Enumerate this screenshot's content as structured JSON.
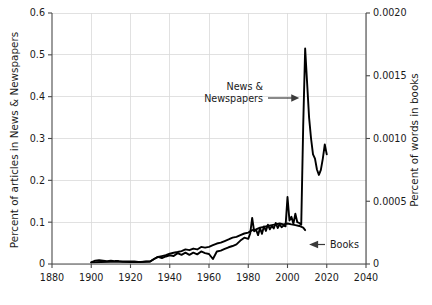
{
  "chart_data": {
    "type": "line",
    "title": "",
    "xlabel": "",
    "ylabel": "Percent of articles in News & Newspapers",
    "y2label": "Percent of words in books",
    "xlim": [
      1880,
      2040
    ],
    "ylim": [
      0,
      0.6
    ],
    "y2lim": [
      0,
      0.002
    ],
    "grid": true,
    "legend": "none (inline annotations)",
    "x_ticks": [
      "1880",
      "1900",
      "1920",
      "1940",
      "1960",
      "1980",
      "2000",
      "2020",
      "2040"
    ],
    "x_tick_values": [
      1880,
      1900,
      1920,
      1940,
      1960,
      1980,
      2000,
      2020,
      2040
    ],
    "y_ticks": [
      "0",
      "0.1",
      "0.2",
      "0.3",
      "0.4",
      "0.5",
      "0.6"
    ],
    "y_tick_values": [
      0,
      0.1,
      0.2,
      0.3,
      0.4,
      0.5,
      0.6
    ],
    "y2_ticks": [
      "0",
      "0.0005",
      "0.0010",
      "0.0015",
      "0.0020"
    ],
    "y2_tick_values": [
      0,
      0.0005,
      0.001,
      0.0015,
      0.002
    ],
    "annotations": [
      {
        "name": "news-newspapers",
        "text_line1": "News &",
        "text_line2": "Newspapers",
        "arrow": "right",
        "points_to_x": 2007,
        "points_to_y": 0.44
      },
      {
        "name": "books",
        "text": "Books",
        "arrow": "left",
        "points_to_x": 2010,
        "points_to_y": 0.08
      }
    ],
    "series": [
      {
        "name": "News & Newspapers",
        "axis": "left",
        "color": "#000000",
        "x": [
          1900,
          1902,
          1904,
          1906,
          1908,
          1910,
          1912,
          1914,
          1916,
          1918,
          1920,
          1922,
          1924,
          1926,
          1928,
          1930,
          1932,
          1934,
          1936,
          1938,
          1940,
          1942,
          1944,
          1946,
          1948,
          1950,
          1952,
          1954,
          1956,
          1958,
          1960,
          1962,
          1964,
          1966,
          1968,
          1970,
          1972,
          1974,
          1976,
          1978,
          1980,
          1981,
          1982,
          1983,
          1984,
          1985,
          1986,
          1987,
          1988,
          1989,
          1990,
          1991,
          1992,
          1993,
          1994,
          1995,
          1996,
          1997,
          1998,
          1999,
          2000,
          2001,
          2002,
          2003,
          2004,
          2005,
          2006,
          2007,
          2008,
          2009,
          2010,
          2011,
          2012,
          2013,
          2014,
          2015,
          2016,
          2017,
          2018,
          2019,
          2020
        ],
        "y": [
          0.004,
          0.008,
          0.009,
          0.008,
          0.007,
          0.008,
          0.007,
          0.007,
          0.006,
          0.006,
          0.006,
          0.006,
          0.005,
          0.005,
          0.006,
          0.006,
          0.012,
          0.017,
          0.014,
          0.018,
          0.021,
          0.019,
          0.026,
          0.022,
          0.027,
          0.022,
          0.027,
          0.023,
          0.03,
          0.026,
          0.024,
          0.012,
          0.03,
          0.032,
          0.036,
          0.04,
          0.043,
          0.047,
          0.056,
          0.063,
          0.06,
          0.073,
          0.11,
          0.078,
          0.082,
          0.069,
          0.086,
          0.072,
          0.09,
          0.079,
          0.094,
          0.083,
          0.091,
          0.085,
          0.098,
          0.086,
          0.095,
          0.088,
          0.092,
          0.09,
          0.16,
          0.104,
          0.113,
          0.096,
          0.12,
          0.1,
          0.098,
          0.094,
          0.33,
          0.515,
          0.432,
          0.35,
          0.3,
          0.262,
          0.252,
          0.226,
          0.213,
          0.225,
          0.252,
          0.286,
          0.262
        ]
      },
      {
        "name": "Books",
        "axis": "right",
        "color": "#000000",
        "x": [
          1900,
          1905,
          1910,
          1915,
          1920,
          1925,
          1930,
          1932,
          1934,
          1936,
          1938,
          1940,
          1942,
          1944,
          1946,
          1948,
          1950,
          1952,
          1954,
          1956,
          1958,
          1960,
          1962,
          1964,
          1966,
          1968,
          1970,
          1972,
          1974,
          1976,
          1978,
          1980,
          1982,
          1984,
          1986,
          1988,
          1990,
          1992,
          1994,
          1996,
          1998,
          2000,
          2002,
          2004,
          2006,
          2008,
          2009
        ],
        "y_right": [
          1.3e-05,
          1.6e-05,
          1.7e-05,
          1.7e-05,
          1.6e-05,
          1.6e-05,
          2e-05,
          4e-05,
          5.6e-05,
          6.3e-05,
          7e-05,
          8.3e-05,
          9e-05,
          9.6e-05,
          0.000103,
          0.000116,
          0.00011,
          0.000123,
          0.000116,
          0.000136,
          0.00013,
          0.000136,
          0.00015,
          0.000163,
          0.00017,
          0.000183,
          0.000196,
          0.00021,
          0.000216,
          0.00023,
          0.000243,
          0.00025,
          0.00027,
          0.000276,
          0.00029,
          0.000296,
          0.000303,
          0.00031,
          0.000316,
          0.000323,
          0.000316,
          0.000323,
          0.000316,
          0.00031,
          0.000303,
          0.00029,
          0.00027
        ]
      }
    ]
  },
  "axes": {
    "left_title": "Percent of articles in News & Newspapers",
    "right_title": "Percent of words in books"
  }
}
